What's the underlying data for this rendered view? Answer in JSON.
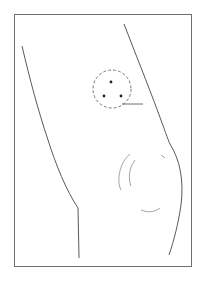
{
  "figure": {
    "kind": "anatomical-line-illustration",
    "colors": {
      "background": "#ffffff",
      "frame": "#6e6e6e",
      "outline": "#5a5a5a",
      "detail": "#9a9a9a",
      "marker_circle": "#7a7a7a",
      "dots": "#222222"
    },
    "frame": {
      "x": 14,
      "y": 14,
      "width": 178,
      "height": 253
    },
    "marker": {
      "circle": {
        "cx": 112,
        "cy": 89,
        "r": 19,
        "style": "dashed"
      },
      "dots": [
        {
          "cx": 111,
          "cy": 82
        },
        {
          "cx": 104,
          "cy": 96
        },
        {
          "cx": 121,
          "cy": 96
        }
      ],
      "leader_line": {
        "x1": 122,
        "y1": 104,
        "x2": 143,
        "y2": 104
      }
    }
  }
}
